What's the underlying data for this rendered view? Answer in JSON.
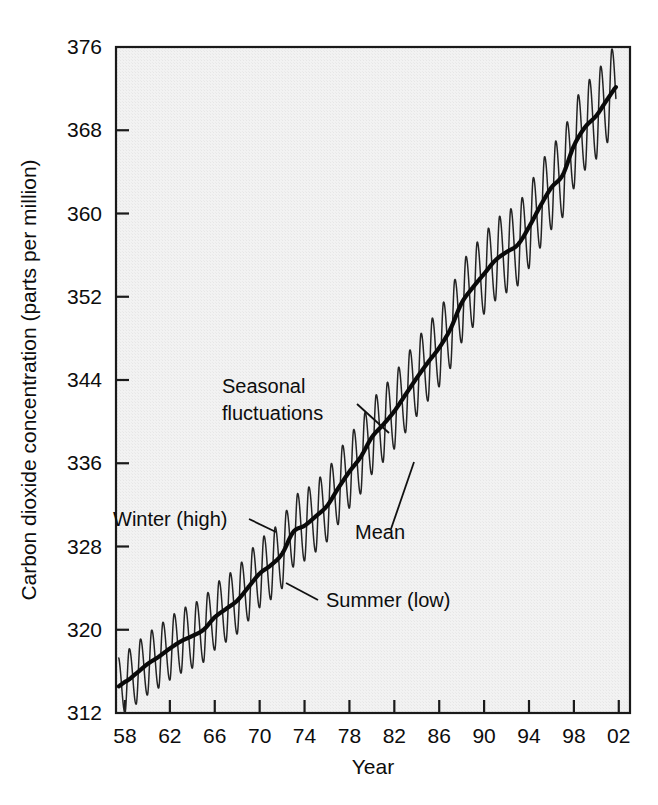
{
  "figure": {
    "name": "keeling-curve-co2-chart",
    "background_color": "#ffffff",
    "plot_fill_color": "#f1f1f1",
    "line_color": "#111111"
  },
  "chart_data": {
    "type": "line",
    "title": "",
    "subtitle": "",
    "xlabel": "Year",
    "ylabel": "Carbon dioxide concentration (parts per million)",
    "xlim": [
      1957.2,
      2003.0
    ],
    "ylim": [
      312,
      376
    ],
    "grid": false,
    "legend": "none",
    "x_tick_labels": [
      "58",
      "62",
      "66",
      "70",
      "74",
      "78",
      "82",
      "86",
      "90",
      "94",
      "98",
      "02"
    ],
    "x_tick_values": [
      1958,
      1962,
      1966,
      1970,
      1974,
      1978,
      1982,
      1986,
      1990,
      1994,
      1998,
      2002
    ],
    "y_tick_labels": [
      "312",
      "320",
      "328",
      "336",
      "344",
      "352",
      "360",
      "368",
      "376"
    ],
    "y_tick_values": [
      312,
      320,
      328,
      336,
      344,
      352,
      360,
      368,
      376
    ],
    "series": [
      {
        "name": "Mean",
        "description": "Smoothed annual mean CO2 trend",
        "x": [
          1958,
          1959,
          1960,
          1961,
          1962,
          1963,
          1964,
          1965,
          1966,
          1967,
          1968,
          1969,
          1970,
          1971,
          1972,
          1973,
          1974,
          1975,
          1976,
          1977,
          1978,
          1979,
          1980,
          1981,
          1982,
          1983,
          1984,
          1985,
          1986,
          1987,
          1988,
          1989,
          1990,
          1991,
          1992,
          1993,
          1994,
          1995,
          1996,
          1997,
          1998,
          1999,
          2000,
          2001,
          2002
        ],
        "values": [
          315.0,
          315.8,
          316.7,
          317.4,
          318.2,
          318.9,
          319.4,
          320.0,
          321.2,
          322.0,
          322.8,
          324.1,
          325.4,
          326.2,
          327.3,
          329.4,
          330.0,
          330.9,
          331.9,
          333.6,
          335.2,
          336.6,
          338.5,
          339.7,
          341.0,
          342.6,
          344.2,
          345.7,
          347.1,
          348.9,
          351.4,
          352.9,
          354.2,
          355.5,
          356.3,
          357.0,
          358.7,
          360.7,
          362.5,
          363.7,
          366.5,
          368.3,
          369.4,
          371.0,
          372.4
        ]
      },
      {
        "name": "Seasonal fluctuations",
        "description": "Monthly oscillation around the mean: winter high, summer low",
        "amplitude_start_ppm": 2.9,
        "amplitude_end_ppm": 4.2,
        "winter_peak_month": 5,
        "summer_trough_month": 10,
        "cycles_per_year": 1
      }
    ],
    "annotations": [
      {
        "name": "seasonal-fluctuations",
        "lines": [
          "Seasonal",
          "fluctuations"
        ],
        "text_x": 222,
        "text_y": 393,
        "leader_from": [
          357,
          404
        ],
        "leader_to": [
          389,
          433
        ]
      },
      {
        "name": "mean",
        "lines": [
          "Mean"
        ],
        "text_x": 355,
        "text_y": 539,
        "leader_from": [
          391,
          529
        ],
        "leader_to": [
          414,
          462
        ]
      },
      {
        "name": "winter-high",
        "lines": [
          "Winter (high)"
        ],
        "text_x": 113,
        "text_y": 526,
        "leader_from": [
          249,
          519
        ],
        "leader_to": [
          276,
          532
        ]
      },
      {
        "name": "summer-low",
        "lines": [
          "Summer (low)"
        ],
        "text_x": 326,
        "text_y": 607,
        "leader_from": [
          318,
          600
        ],
        "leader_to": [
          286,
          583
        ]
      }
    ]
  }
}
